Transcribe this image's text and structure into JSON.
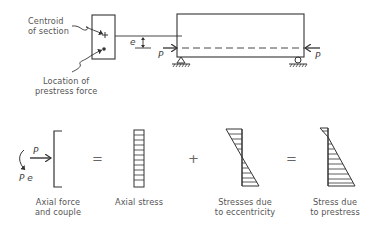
{
  "figure": {
    "top": {
      "section_labels": {
        "centroid": [
          "Centroid",
          "of section"
        ],
        "prestress_location": [
          "Location of",
          "prestress force"
        ]
      },
      "symbols": {
        "eccentricity": "e",
        "force_left": "P",
        "force_right": "P"
      }
    },
    "bottom": {
      "operators": [
        "=",
        "+",
        "="
      ],
      "force_symbols": {
        "force": "P",
        "moment": "P e"
      },
      "captions": [
        [
          "Axial force",
          "and couple"
        ],
        [
          "Axial stress"
        ],
        [
          "Stresses due",
          "to eccentricity"
        ],
        [
          "Stress due",
          "to prestress"
        ]
      ]
    },
    "colors": {
      "ink": "#333333",
      "label": "#555555"
    }
  }
}
